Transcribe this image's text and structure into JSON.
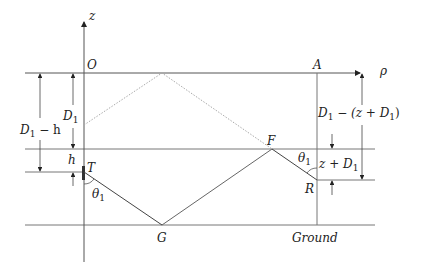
{
  "diagram": {
    "type": "two-ray ground reflection geometry",
    "axes": {
      "z_label": "z",
      "rho_label": "ρ",
      "origin_label": "O"
    },
    "points": {
      "origin": "O",
      "a": "A",
      "transmitter": "T",
      "receiver": "R",
      "ground_reflection": "G",
      "f": "F"
    },
    "dimensions": {
      "d1_minus_h": {
        "main": "D",
        "sub": "1",
        "rest": " − h"
      },
      "d1": {
        "main": "D",
        "sub": "1"
      },
      "h": "h",
      "right_top": {
        "a": "D",
        "asub": "1",
        "b": " − (z + D",
        "bsub": "1",
        "c": ")"
      },
      "z_plus_d1": {
        "a": "z + D",
        "asub": "1"
      }
    },
    "angles": {
      "theta_t": {
        "main": "θ",
        "sub": "1"
      },
      "theta_r": {
        "main": "θ",
        "sub": "1"
      }
    },
    "ground_label": "Ground",
    "colors": {
      "line": "#555555",
      "ray": "#444444",
      "dotted": "#aaaaaa",
      "text": "#222222"
    }
  }
}
